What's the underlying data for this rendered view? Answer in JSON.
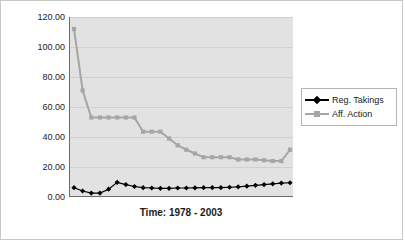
{
  "chart_data": {
    "type": "line",
    "title": "",
    "xlabel": "Time: 1978 - 2003",
    "ylabel": "Average # Amici / Case",
    "ylim": [
      0,
      120
    ],
    "ytick_labels": [
      "120.00",
      "100.00",
      "80.00",
      "60.00",
      "40.00",
      "20.00",
      "0.00"
    ],
    "ytick_values": [
      120,
      100,
      80,
      60,
      40,
      20,
      0
    ],
    "grid": "horizontal",
    "legend_position": "right",
    "x": [
      1978,
      1979,
      1980,
      1981,
      1982,
      1983,
      1984,
      1985,
      1986,
      1987,
      1988,
      1989,
      1990,
      1991,
      1992,
      1993,
      1994,
      1995,
      1996,
      1997,
      1998,
      1999,
      2000,
      2001,
      2002,
      2003
    ],
    "series": [
      {
        "name": "Reg. Takings",
        "color": "#000000",
        "marker": "diamond",
        "values": [
          6.2,
          4.0,
          2.6,
          2.6,
          5.2,
          9.8,
          8.3,
          7.0,
          6.2,
          6.0,
          5.8,
          5.8,
          6.0,
          6.0,
          6.1,
          6.2,
          6.3,
          6.3,
          6.5,
          6.8,
          7.2,
          7.8,
          8.3,
          8.8,
          9.3,
          9.5
        ]
      },
      {
        "name": "Aff. Action",
        "color": "#a6a6a6",
        "marker": "square",
        "values": [
          112.0,
          71.0,
          53.0,
          53.0,
          53.0,
          53.0,
          53.0,
          53.0,
          43.5,
          43.5,
          43.5,
          39.0,
          34.5,
          31.5,
          29.0,
          26.5,
          26.5,
          26.5,
          26.5,
          25.0,
          25.0,
          25.0,
          24.5,
          24.0,
          24.0,
          31.5
        ]
      }
    ]
  },
  "legend": {
    "items": [
      {
        "label": "Reg. Takings"
      },
      {
        "label": "Aff. Action"
      }
    ]
  }
}
